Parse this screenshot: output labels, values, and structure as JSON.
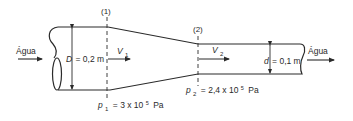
{
  "diagram": {
    "inlet_label": "Água",
    "outlet_label": "Água",
    "section_1": {
      "marker": "(1)",
      "diameter_symbol": "D",
      "diameter_value": "= 0,2 m",
      "velocity_symbol": "V",
      "velocity_subscript": "1",
      "pressure_symbol": "p",
      "pressure_subscript": "1",
      "pressure_value": "= 3 x 10",
      "pressure_exponent": "5",
      "pressure_unit": "Pa"
    },
    "section_2": {
      "marker": "(2)",
      "diameter_symbol": "d",
      "diameter_value": "= 0,1 m",
      "velocity_symbol": "V",
      "velocity_subscript": "2",
      "pressure_symbol": "p",
      "pressure_subscript": "2",
      "pressure_value": "= 2,4 x 10",
      "pressure_exponent": "5",
      "pressure_unit": "Pa"
    },
    "colors": {
      "line": "#2a2a2a",
      "background": "#ffffff"
    }
  }
}
